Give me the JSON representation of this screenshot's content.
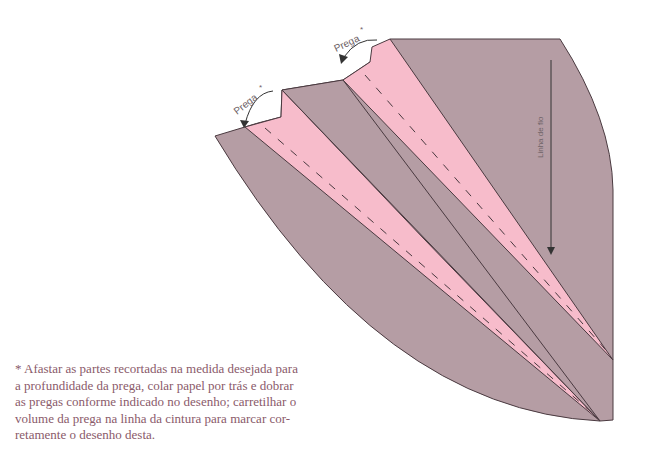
{
  "diagram": {
    "labels": {
      "pleat_1": "Prega",
      "pleat_2": "Prega",
      "asterisk": "*",
      "grain_line": "Linha de fio"
    },
    "colors": {
      "fabric": "#b59da4",
      "pleat_inside": "#f7bccb",
      "outline": "#4a3a40",
      "arrow": "#333333"
    }
  },
  "note": {
    "lines": [
      "* Afastar as partes recortadas na medida desejada para",
      "a profundidade da prega, colar papel por trás e dobrar",
      "as pregas conforme indicado no desenho; carretilhar o",
      "volume da prega na linha da cintura para marcar cor-",
      "retamente o desenho desta."
    ]
  }
}
